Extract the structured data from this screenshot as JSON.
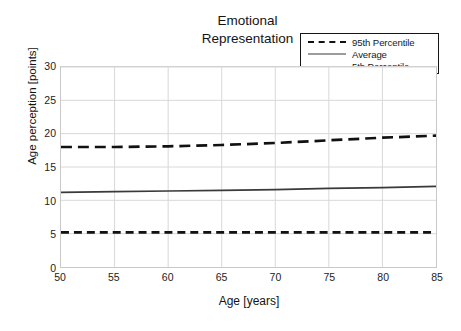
{
  "chart_data": {
    "type": "line",
    "title": "Emotional Representation",
    "title_lines": [
      "Emotional",
      "Representation"
    ],
    "xlabel": "Age [years]",
    "ylabel": "Age perception [points]",
    "xlim": [
      50,
      85
    ],
    "ylim": [
      0,
      30
    ],
    "xticks": [
      50,
      55,
      60,
      65,
      70,
      75,
      80,
      85
    ],
    "yticks": [
      0,
      5,
      10,
      15,
      20,
      25,
      30
    ],
    "grid": true,
    "legend_position": "top-right",
    "x": [
      50,
      55,
      60,
      65,
      70,
      75,
      80,
      85
    ],
    "series": [
      {
        "name": "95th Percentile",
        "style": "dashed-long",
        "color": "#111111",
        "values": [
          18.0,
          18.0,
          18.1,
          18.3,
          18.6,
          19.0,
          19.4,
          19.7
        ]
      },
      {
        "name": "Average",
        "style": "solid",
        "color": "#3a3a3a",
        "values": [
          11.2,
          11.3,
          11.4,
          11.5,
          11.6,
          11.8,
          11.9,
          12.1
        ]
      },
      {
        "name": "5th Percentile",
        "style": "dashed-short",
        "color": "#111111",
        "values": [
          5.2,
          5.2,
          5.2,
          5.2,
          5.2,
          5.2,
          5.2,
          5.2
        ]
      }
    ]
  },
  "legend": {
    "entries": [
      {
        "label": "95th Percentile"
      },
      {
        "label": "Average"
      },
      {
        "label": "5th Percentile"
      }
    ]
  }
}
